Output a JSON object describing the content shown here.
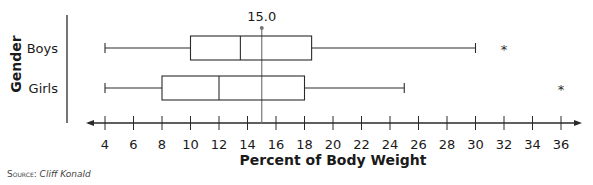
{
  "chart_data": {
    "type": "boxplot",
    "title": "",
    "xlabel": "Percent of Body Weight",
    "ylabel": "Gender",
    "xlim": [
      4,
      36
    ],
    "xticks": [
      4,
      6,
      8,
      10,
      12,
      14,
      16,
      18,
      20,
      22,
      24,
      26,
      28,
      30,
      32,
      34,
      36
    ],
    "grid": false,
    "reference_line": {
      "value": 15.0,
      "label": "15.0"
    },
    "series": [
      {
        "name": "Boys",
        "min": 4,
        "q1": 10,
        "median": 13.5,
        "q3": 18.5,
        "max": 30,
        "outliers": [
          32
        ]
      },
      {
        "name": "Girls",
        "min": 4,
        "q1": 8,
        "median": 12,
        "q3": 18,
        "max": 25,
        "outliers": [
          36
        ]
      }
    ]
  },
  "source": {
    "label": "Source:",
    "value": "Cliff Konald"
  }
}
